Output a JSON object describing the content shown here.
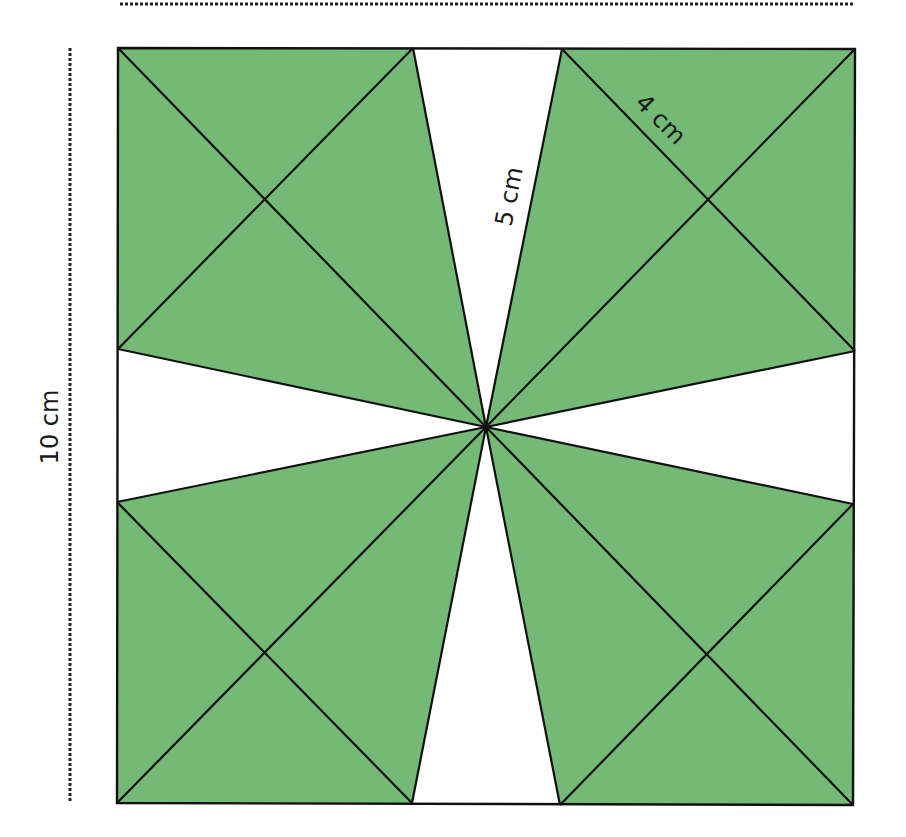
{
  "diagram": {
    "type": "geometry-figure",
    "colors": {
      "shaded": "#74b976",
      "lines": "#111111",
      "background": "#ffffff"
    },
    "labels": {
      "side_length": "10 cm",
      "kite_edge": "5 cm",
      "small_square_half_diagonal": "4 cm"
    },
    "dimension_lines": {
      "top": "dotted",
      "left": "dotted"
    }
  }
}
